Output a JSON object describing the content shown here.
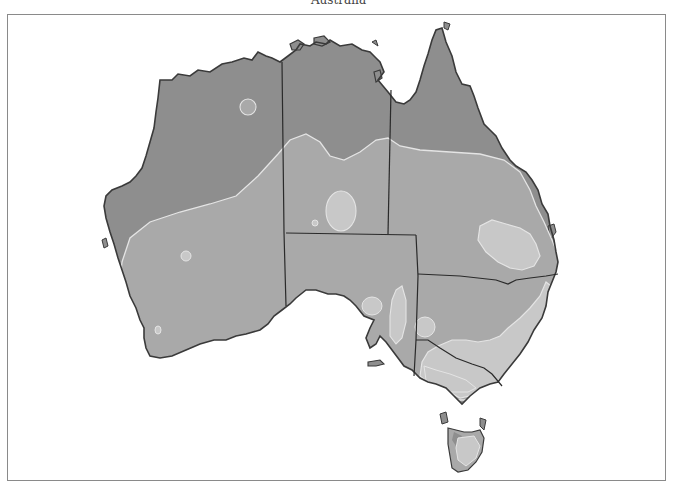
{
  "map": {
    "title": "Australia",
    "colors": {
      "background": "#ffffff",
      "frame": "#8a8a8a",
      "zone_dark": "#8e8e8e",
      "zone_medium": "#a9a9a9",
      "zone_light": "#c8c8c8",
      "zone_outline": "#e4e4e4",
      "coastline": "#3a3a3a",
      "state_border": "#2a2a2a"
    },
    "regions": [
      "Western Australia",
      "Northern Territory",
      "Queensland",
      "South Australia",
      "New South Wales",
      "Victoria",
      "Tasmania"
    ]
  }
}
